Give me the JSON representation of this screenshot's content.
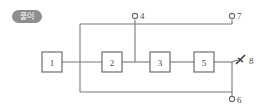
{
  "badge": {
    "label": "풀이"
  },
  "diagram": {
    "blocks": [
      {
        "id": "block-1",
        "label": "1",
        "x": 42,
        "y": 52,
        "w": 20,
        "h": 20
      },
      {
        "id": "block-2",
        "label": "2",
        "x": 102,
        "y": 52,
        "w": 20,
        "h": 20
      },
      {
        "id": "block-3",
        "label": "3",
        "x": 150,
        "y": 52,
        "w": 20,
        "h": 20
      },
      {
        "id": "block-5",
        "label": "5",
        "x": 194,
        "y": 52,
        "w": 20,
        "h": 20
      }
    ],
    "terminals": [
      {
        "id": "terminal-4",
        "label": "4",
        "cx": 135,
        "cy": 15,
        "labelx": 140,
        "labely": 18
      },
      {
        "id": "terminal-7",
        "label": "7",
        "cx": 232,
        "cy": 15,
        "labelx": 237,
        "labely": 18
      },
      {
        "id": "terminal-6",
        "label": "6",
        "cx": 232,
        "cy": 101,
        "labelx": 237,
        "labely": 105
      },
      {
        "id": "terminal-8",
        "label": "8",
        "cx": 244,
        "cy": 60,
        "labelx": 252,
        "labely": 65
      }
    ],
    "wires": [
      "M 62 62 L 102 62",
      "M 122 62 L 150 62",
      "M 170 62 L 194 62",
      "M 214 62 L 237 59",
      "M 135 20 L 135 62",
      "M 80 24 L 80 92",
      "M 80 24 L 232 24",
      "M 80 92 L 232 92",
      "M 232 20 L 232 24",
      "M 232 59 L 232 96",
      "M 232 96 L 232 96"
    ],
    "arrow_marker": {
      "name": "terminal-8-arrow",
      "path": "M 234 64 L 243 56",
      "barb1": "M 236 58 L 241 62"
    }
  }
}
